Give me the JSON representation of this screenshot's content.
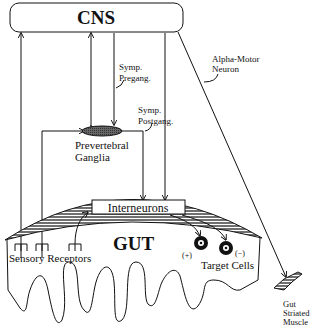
{
  "diagram": {
    "cns": {
      "label": "CNS"
    },
    "gut": {
      "label": "GUT"
    },
    "interneurons": {
      "label": "Interneurons"
    },
    "ganglia": {
      "line1": "Prevertebral",
      "line2": "Ganglia"
    },
    "symp_pregang": {
      "line1": "Symp.",
      "line2": "Pregang."
    },
    "symp_postgang": {
      "line1": "Symp.",
      "line2": "Postgang."
    },
    "alpha_motor": {
      "line1": "Alpha-Motor",
      "line2": "Neuron"
    },
    "sensory_receptors": {
      "label": "Sensory Receptors"
    },
    "target_cells": {
      "label": "Target Cells",
      "plus": "(+)",
      "minus": "(−)"
    },
    "gut_muscle": {
      "line1": "Gut",
      "line2": "Striated",
      "line3": "Muscle"
    }
  }
}
